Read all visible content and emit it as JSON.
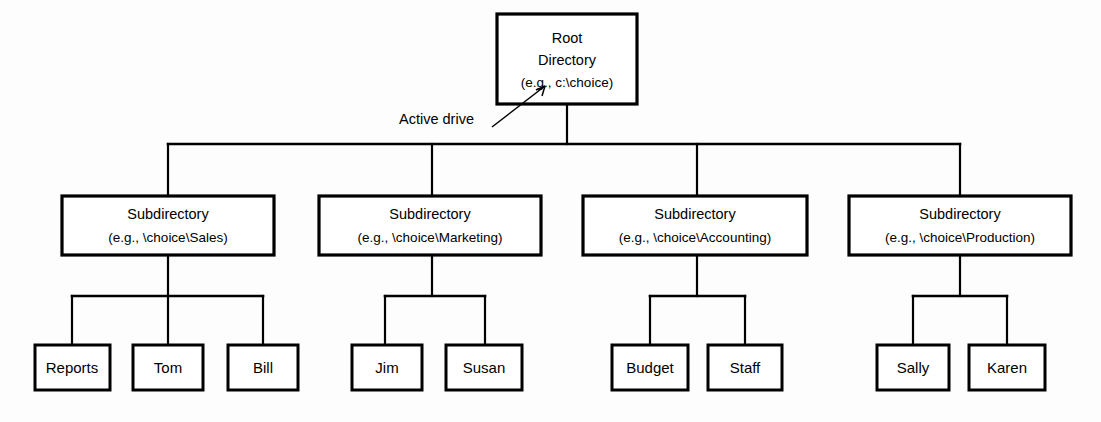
{
  "diagram": {
    "root": {
      "line1": "Root",
      "line2": "Directory",
      "line3": "(e.g., c:\\choice)"
    },
    "annotation": {
      "label": "Active drive",
      "points_to": "c:"
    },
    "subdirectories": [
      {
        "line1": "Subdirectory",
        "line2": "(e.g., \\choice\\Sales)",
        "children": [
          {
            "label": "Reports"
          },
          {
            "label": "Tom"
          },
          {
            "label": "Bill"
          }
        ]
      },
      {
        "line1": "Subdirectory",
        "line2": "(e.g., \\choice\\Marketing)",
        "children": [
          {
            "label": "Jim"
          },
          {
            "label": "Susan"
          }
        ]
      },
      {
        "line1": "Subdirectory",
        "line2": "(e.g., \\choice\\Accounting)",
        "children": [
          {
            "label": "Budget"
          },
          {
            "label": "Staff"
          }
        ]
      },
      {
        "line1": "Subdirectory",
        "line2": "(e.g., \\choice\\Production)",
        "children": [
          {
            "label": "Sally"
          },
          {
            "label": "Karen"
          }
        ]
      }
    ],
    "colors": {
      "stroke": "#000000",
      "fill": "#ffffff",
      "background": "#fdfdfd"
    }
  }
}
